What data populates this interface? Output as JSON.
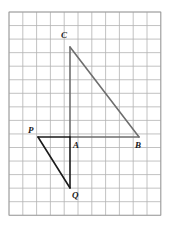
{
  "figure": {
    "kind": "geometry-grid-diagram",
    "background_color": "#ffffff",
    "grid": {
      "origin_x": 9,
      "origin_y": 12,
      "columns": 11,
      "rows": 15,
      "cell_width": 13.8,
      "cell_height": 13.55,
      "line_color": "#b3b3b3",
      "border_color": "#9a9a9a",
      "line_width": 0.8,
      "visible": true
    },
    "shapes": [
      {
        "name": "triangle-acb",
        "label": "Triangle ACB",
        "stroke_color": "#6e6e6e",
        "stroke_width": 1.6,
        "fill": "none",
        "vertices": [
          {
            "id": "A",
            "x": 70,
            "y": 137
          },
          {
            "id": "C",
            "x": 70,
            "y": 47
          },
          {
            "id": "B",
            "x": 139,
            "y": 137
          }
        ]
      },
      {
        "name": "triangle-apq",
        "label": "Triangle APQ",
        "stroke_color": "#1a1a1a",
        "stroke_width": 1.6,
        "fill": "none",
        "vertices": [
          {
            "id": "A",
            "x": 70,
            "y": 137
          },
          {
            "id": "P",
            "x": 38,
            "y": 137
          },
          {
            "id": "Q",
            "x": 70,
            "y": 188
          }
        ]
      }
    ],
    "segments": [
      {
        "name": "segment-ca",
        "from": "C",
        "to": "A",
        "color": "#6e6e6e"
      },
      {
        "name": "segment-cb",
        "from": "C",
        "to": "B",
        "color": "#6e6e6e"
      },
      {
        "name": "segment-ab",
        "from": "A",
        "to": "B",
        "color": "#6e6e6e"
      },
      {
        "name": "segment-pa",
        "from": "P",
        "to": "A",
        "color": "#1a1a1a"
      },
      {
        "name": "segment-pq",
        "from": "P",
        "to": "Q",
        "color": "#1a1a1a"
      },
      {
        "name": "segment-aq",
        "from": "A",
        "to": "Q",
        "color": "#1a1a1a"
      }
    ],
    "point_labels": [
      {
        "id": "label-c",
        "text": "C",
        "x": 61,
        "y": 31
      },
      {
        "id": "label-p",
        "text": "P",
        "x": 28,
        "y": 126
      },
      {
        "id": "label-a",
        "text": "A",
        "x": 73,
        "y": 141
      },
      {
        "id": "label-b",
        "text": "B",
        "x": 135,
        "y": 141
      },
      {
        "id": "label-q",
        "text": "Q",
        "x": 72,
        "y": 191
      }
    ]
  }
}
